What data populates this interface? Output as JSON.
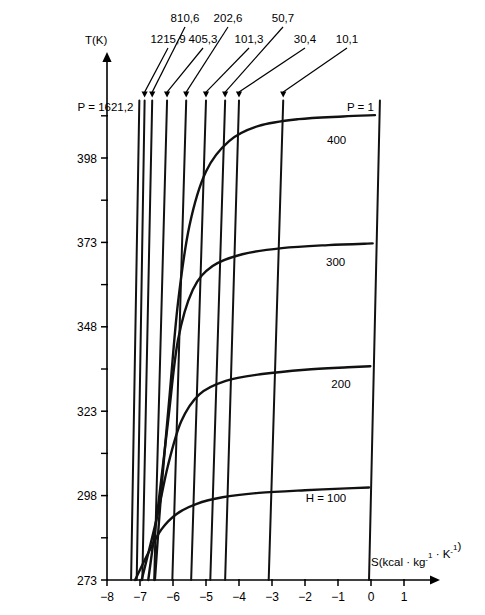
{
  "chart_data": {
    "type": "line",
    "title": "",
    "xlabel": "S(kcal · kg⁻¹ · K⁻¹)",
    "ylabel": "T(K)",
    "xlim": [
      -8,
      1.55
    ],
    "ylim": [
      273,
      415
    ],
    "grid": false,
    "legend_position": "inline-annotations",
    "x_ticks": [
      -8,
      -7,
      -6,
      -5,
      -4,
      -3,
      -2,
      -1,
      0,
      1
    ],
    "x_tick_labels": [
      "−8",
      "−7",
      "−6",
      "−5",
      "−4",
      "−3",
      "−2",
      "−1",
      "0",
      "1"
    ],
    "y_ticks": [
      273,
      298,
      323,
      348,
      373,
      398
    ],
    "y_tick_labels": [
      "273",
      "298",
      "323",
      "348",
      "373",
      "398"
    ],
    "y_minor_ticks": [
      285.5,
      310.5,
      335.5,
      360.5,
      385.5,
      410.5
    ],
    "isobars": {
      "label_prefix": "P = ",
      "unit_note": "",
      "lines": [
        {
          "label": "P = 1621,2",
          "value": 1621.2,
          "label_style": "left-inline",
          "s_at_273": -7.27,
          "s_at_top": -7.02
        },
        {
          "label": "1215,9",
          "value": 1215.9,
          "label_style": "arrow",
          "s_at_273": -7.1,
          "s_at_top": -6.86
        },
        {
          "label": "810,6",
          "value": 810.6,
          "label_style": "arrow",
          "s_at_273": -6.93,
          "s_at_top": -6.63
        },
        {
          "label": "405,3",
          "value": 405.3,
          "label_style": "arrow",
          "s_at_273": -6.57,
          "s_at_top": -6.18
        },
        {
          "label": "202,6",
          "value": 202.6,
          "label_style": "arrow",
          "s_at_273": -6.02,
          "s_at_top": -5.6
        },
        {
          "label": "101,3",
          "value": 101.3,
          "label_style": "arrow",
          "s_at_273": -5.45,
          "s_at_top": -5.0
        },
        {
          "label": "50,7",
          "value": 50.7,
          "label_style": "arrow",
          "s_at_273": -4.87,
          "s_at_top": -4.42
        },
        {
          "label": "30,4",
          "value": 30.4,
          "label_style": "arrow",
          "s_at_273": -4.42,
          "s_at_top": -4.0
        },
        {
          "label": "10,1",
          "value": 10.1,
          "label_style": "arrow",
          "s_at_273": -3.1,
          "s_at_top": -2.66
        },
        {
          "label": "P = 1",
          "value": 1,
          "label_style": "right-inline",
          "s_at_273": -0.06,
          "s_at_top": 0.27
        }
      ]
    },
    "isenthalps": {
      "label_prefix": "H = ",
      "curves": [
        {
          "label": "H = 100",
          "value": 100,
          "label_anchor_s": -0.75,
          "label_anchor_t": 296,
          "points": [
            [
              -7.15,
              273
            ],
            [
              -6.75,
              281
            ],
            [
              -6.35,
              288
            ],
            [
              -5.9,
              292.5
            ],
            [
              -5.3,
              295.5
            ],
            [
              -4.5,
              297.5
            ],
            [
              -3.4,
              298.8
            ],
            [
              -2.0,
              299.6
            ],
            [
              -0.55,
              300.2
            ],
            [
              -0.06,
              300.4
            ]
          ]
        },
        {
          "label": "200",
          "value": 200,
          "label_anchor_s": -0.62,
          "label_anchor_t": 330,
          "points": [
            [
              -6.95,
              273
            ],
            [
              -6.5,
              291
            ],
            [
              -6.15,
              307
            ],
            [
              -5.75,
              320
            ],
            [
              -5.2,
              328
            ],
            [
              -4.4,
              332
            ],
            [
              -3.3,
              334
            ],
            [
              -2.0,
              335.3
            ],
            [
              -0.7,
              336
            ],
            [
              -0.02,
              336.3
            ]
          ]
        },
        {
          "label": "300",
          "value": 300,
          "label_anchor_s": -0.78,
          "label_anchor_t": 366,
          "points": [
            [
              -6.75,
              273
            ],
            [
              -6.45,
              295
            ],
            [
              -6.15,
              320
            ],
            [
              -5.85,
              344
            ],
            [
              -5.4,
              359
            ],
            [
              -4.8,
              366
            ],
            [
              -3.9,
              369.5
            ],
            [
              -2.7,
              371.3
            ],
            [
              -1.3,
              372.2
            ],
            [
              0.05,
              372.7
            ]
          ]
        },
        {
          "label": "400",
          "value": 400,
          "label_anchor_s": -0.75,
          "label_anchor_t": 402,
          "points": [
            [
              -6.55,
              273
            ],
            [
              -6.35,
              300
            ],
            [
              -6.1,
              328
            ],
            [
              -5.85,
              355
            ],
            [
              -5.5,
              378
            ],
            [
              -5.0,
              394
            ],
            [
              -4.3,
              403
            ],
            [
              -3.4,
              407.5
            ],
            [
              -2.2,
              409.5
            ],
            [
              -0.85,
              410.3
            ],
            [
              0.12,
              410.7
            ]
          ]
        }
      ]
    }
  }
}
